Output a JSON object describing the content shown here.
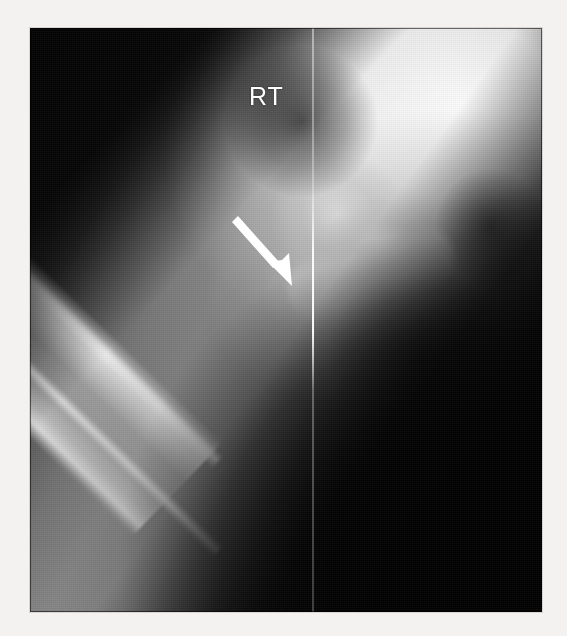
{
  "image": {
    "modality": "radiograph",
    "view_description": "Anteroposterior radiograph of the right hip and proximal femur",
    "background_color": "#f3f2f0",
    "film_background_color": "#0a0a0a"
  },
  "annotations": {
    "laterality_marker": {
      "label": "RT",
      "meaning": "right side laterality marker",
      "color": "#ffffff",
      "x": 250,
      "y": 88
    },
    "arrow": {
      "label": "",
      "description": "white arrow indicating cortical lesion along the proximolateral femoral shaft",
      "color": "#ffffff",
      "tail_x": 205,
      "tail_y": 192,
      "tip_x": 262,
      "tip_y": 250,
      "direction": "down-right"
    },
    "collimation_line": {
      "description": "vertical collimation edge",
      "color": "#ffffff",
      "x": 312
    }
  },
  "anatomy": [
    {
      "name": "femoral-shaft",
      "description": "diagonal long bone with bright cortical margins"
    },
    {
      "name": "femoral-neck",
      "description": "short oblique segment between shaft and head"
    },
    {
      "name": "greater-trochanter",
      "description": "bony prominence lateral to femoral neck"
    },
    {
      "name": "femoral-head",
      "description": "rounded bone seated in the acetabulum"
    },
    {
      "name": "acetabulum",
      "description": "cup of the pelvis articulating with femoral head"
    },
    {
      "name": "pelvis",
      "description": "bright dense bone occupying the upper right field"
    },
    {
      "name": "soft-tissue",
      "description": "grey thigh soft tissue envelope surrounding the femur"
    }
  ]
}
